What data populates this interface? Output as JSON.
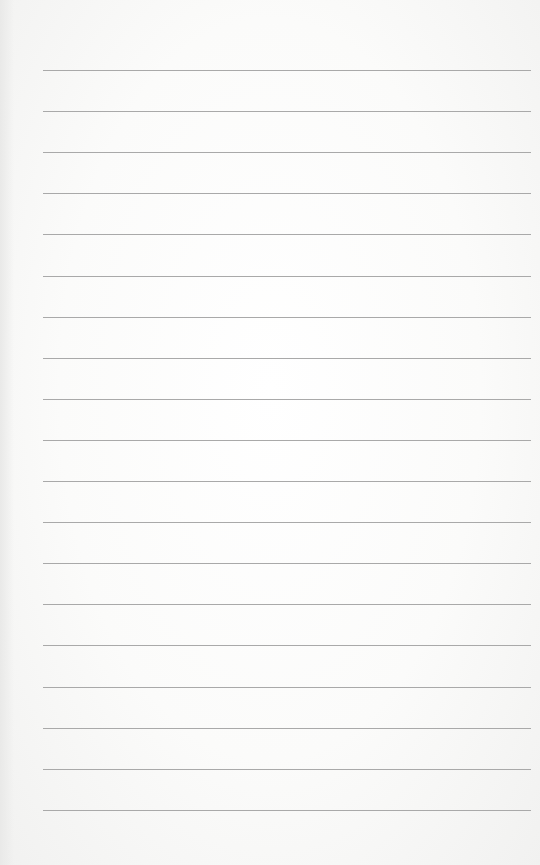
{
  "sheet": {
    "type": "lined-paper",
    "background_color": "#fbfbfa",
    "line_color": "#a9a9a9",
    "line_count": 19,
    "first_line_y": 70,
    "line_spacing": 41.1,
    "line_left": 43,
    "line_right_margin": 9
  }
}
